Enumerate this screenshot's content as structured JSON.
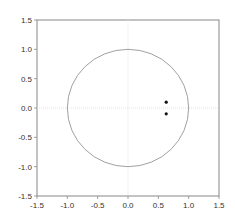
{
  "chart_data": {
    "type": "scatter",
    "title": "",
    "xlabel": "",
    "ylabel": "",
    "xlim": [
      -1.5,
      1.5
    ],
    "ylim": [
      -1.5,
      1.5
    ],
    "grid": "dotted zero lines",
    "xticks": [
      "-1.5",
      "-1.0",
      "-0.5",
      "0.0",
      "0.5",
      "1.0",
      "1.5"
    ],
    "yticks": [
      "1.5",
      "1.0",
      "0.5",
      "0.0",
      "-0.5",
      "-1.0",
      "-1.5"
    ],
    "circle": {
      "center": [
        0,
        0
      ],
      "radius": 1.0
    },
    "points": [
      {
        "x": 0.63,
        "y": 0.1
      },
      {
        "x": 0.63,
        "y": -0.1
      }
    ]
  }
}
